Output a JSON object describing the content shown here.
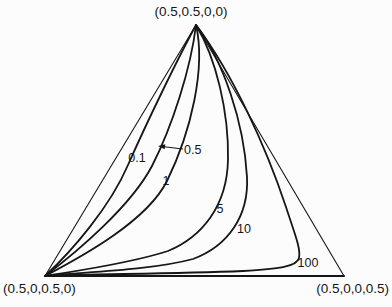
{
  "figure": {
    "background": "#fcfcfc",
    "ink_color": "#161616",
    "width": 392,
    "height": 307
  },
  "chart_data": {
    "type": "line",
    "diagram": "quaternary-simplex-triangle",
    "title": "",
    "grid": false,
    "legend": "inline-curve-labels",
    "vertices": [
      {
        "id": "top",
        "label": "(0.5,0.5,0,0)",
        "x": 196,
        "y": 25
      },
      {
        "id": "bottom-left",
        "label": "(0.5,0,0.5,0)",
        "x": 45,
        "y": 276
      },
      {
        "id": "bottom-right",
        "label": "(0.5,0,0,0.5)",
        "x": 344,
        "y": 276
      }
    ],
    "vertex_labels": [
      {
        "id": "vertex-label-top",
        "text": "(0.5,0.5,0,0)",
        "x": 191,
        "y": 16,
        "anchor": "middle",
        "size": 13.5
      },
      {
        "id": "vertex-label-bottom-left",
        "text": "(0.5,0,0.5,0)",
        "x": 3,
        "y": 293,
        "anchor": "start",
        "size": 13.5
      },
      {
        "id": "vertex-label-bottom-right",
        "text": "(0.5,0,0,0.5)",
        "x": 389,
        "y": 293,
        "anchor": "end",
        "size": 13.5
      }
    ],
    "triangle_edges": [
      {
        "id": "left-edge",
        "path": "M196,25 L45,276",
        "stroke_width": 1.1
      },
      {
        "id": "right-edge",
        "path": "M196,25 L344,276",
        "stroke_width": 1.1
      },
      {
        "id": "bottom-edge",
        "path": "M45,276 L344,276",
        "stroke_width": 2.0
      }
    ],
    "series": [
      {
        "name": "0.1",
        "path": "M196,25 C177,60 147,122 128,165 C110,207 72,251 45,276",
        "stroke_width": 1.8
      },
      {
        "name": "0.5",
        "path": "M196,25 C191,68 172,127 152,166 C131,206 78,251 45,276",
        "stroke_width": 1.8
      },
      {
        "name": "1",
        "path": "M196,25 C206,68 191,132 167,181 C147,221 83,256 45,276",
        "stroke_width": 1.8
      },
      {
        "name": "5",
        "path": "M196,25 C216,58 229,112 228,160 C227,206 202,237 168,251 C128,264 75,271 45,276",
        "stroke_width": 1.8
      },
      {
        "name": "10",
        "path": "M196,25 C223,60 244,122 247,177 C249,216 228,246 193,259 C148,271 80,272 45,276",
        "stroke_width": 1.8
      },
      {
        "name": "100",
        "path": "M196,25 C233,74 266,147 286,207 C294,232 301,248 299,258 C297,267 277,269 243,271 C168,274 88,274 45,276",
        "stroke_width": 1.8
      }
    ],
    "curve_labels": [
      {
        "for": "0.1",
        "text": "0.1",
        "x": 137,
        "y": 162,
        "anchor": "middle",
        "size": 12.5
      },
      {
        "for": "0.5",
        "text": "0.5",
        "x": 184,
        "y": 153.5,
        "anchor": "start",
        "size": 12.5
      },
      {
        "for": "1",
        "text": "1",
        "x": 166,
        "y": 185,
        "anchor": "middle",
        "size": 12.5
      },
      {
        "for": "5",
        "text": "5",
        "x": 220,
        "y": 213,
        "anchor": "middle",
        "size": 12.5
      },
      {
        "for": "10",
        "text": "10",
        "x": 244,
        "y": 233,
        "anchor": "middle",
        "size": 12.5
      },
      {
        "for": "100",
        "text": "100",
        "x": 308,
        "y": 267,
        "anchor": "middle",
        "size": 12.5
      }
    ],
    "annotation_arrow": {
      "for": "0.5",
      "tail_x": 183,
      "tail_y": 149,
      "tip_x": 160,
      "tip_y": 146.3,
      "head_points": "158,146 165.3,144.3 164.7,149.3",
      "stroke_width": 1.1
    }
  }
}
